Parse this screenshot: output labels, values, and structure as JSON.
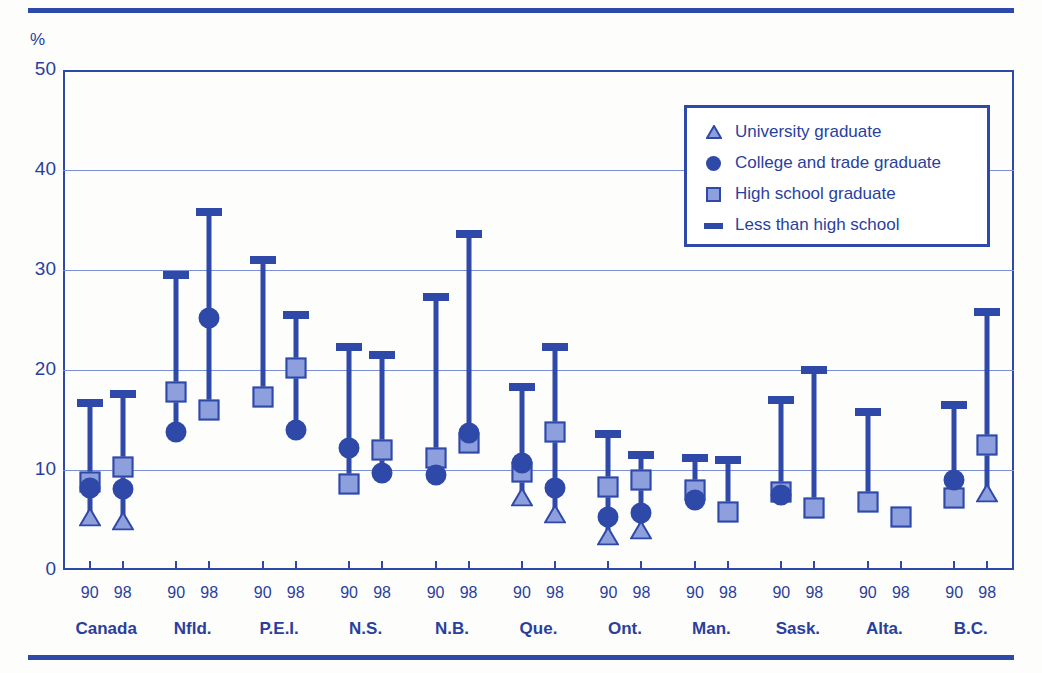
{
  "axis": {
    "y_unit_label": "%",
    "y_ticks": [
      "0",
      "10",
      "20",
      "30",
      "40",
      "50"
    ],
    "y_min": 0,
    "y_max": 50
  },
  "legend": {
    "position": "top-right-inside",
    "items": [
      {
        "symbol": "triangle",
        "label": "University graduate"
      },
      {
        "symbol": "circle",
        "label": "College and trade graduate"
      },
      {
        "symbol": "square",
        "label": "High school graduate"
      },
      {
        "symbol": "dash",
        "label": "Less than high school"
      }
    ]
  },
  "colors": {
    "line": "#2f49a8",
    "fill_light": "#8e9fdd",
    "text": "#2a3f9d",
    "gridline": "#7a8fd6",
    "background": "#fdfdfc"
  },
  "chart_data": {
    "type": "scatter",
    "title": "",
    "xlabel": "",
    "ylabel": "%",
    "ylim": [
      0,
      50
    ],
    "ytick_values": [
      0,
      10,
      20,
      30,
      40,
      50
    ],
    "grid": "horizontal",
    "legend_position": "top-right",
    "categories": [
      "Canada",
      "Nfld.",
      "P.E.I.",
      "N.S.",
      "N.B.",
      "Que.",
      "Ont.",
      "Man.",
      "Sask.",
      "Alta.",
      "B.C."
    ],
    "years": [
      "90",
      "98"
    ],
    "series": [
      {
        "name": "University graduate",
        "symbol": "triangle"
      },
      {
        "name": "College and trade graduate",
        "symbol": "circle"
      },
      {
        "name": "High school graduate",
        "symbol": "square"
      },
      {
        "name": "Less than high school",
        "symbol": "dash"
      }
    ],
    "groups": [
      {
        "region": "Canada",
        "year": "90",
        "university": 5.3,
        "college": 8.2,
        "high_school": 8.8,
        "less_than_high_school": 16.7
      },
      {
        "region": "Canada",
        "year": "98",
        "university": 4.9,
        "college": 8.1,
        "high_school": 10.3,
        "less_than_high_school": 17.6
      },
      {
        "region": "Nfld.",
        "year": "90",
        "university": null,
        "college": 13.8,
        "high_school": 17.8,
        "less_than_high_school": 29.5
      },
      {
        "region": "Nfld.",
        "year": "98",
        "university": null,
        "college": 25.2,
        "high_school": 16.0,
        "less_than_high_school": 35.8
      },
      {
        "region": "P.E.I.",
        "year": "90",
        "university": null,
        "college": null,
        "high_school": 17.3,
        "less_than_high_school": 31.0
      },
      {
        "region": "P.E.I.",
        "year": "98",
        "university": null,
        "college": 14.0,
        "high_school": 20.2,
        "less_than_high_school": 25.5
      },
      {
        "region": "N.S.",
        "year": "90",
        "university": null,
        "college": 12.2,
        "high_school": 8.6,
        "less_than_high_school": 22.3
      },
      {
        "region": "N.S.",
        "year": "98",
        "university": null,
        "college": 9.7,
        "high_school": 12.0,
        "less_than_high_school": 21.5
      },
      {
        "region": "N.B.",
        "year": "90",
        "university": null,
        "college": 9.5,
        "high_school": 11.2,
        "less_than_high_school": 27.3
      },
      {
        "region": "N.B.",
        "year": "98",
        "university": null,
        "college": 13.7,
        "high_school": 12.7,
        "less_than_high_school": 33.6
      },
      {
        "region": "Que.",
        "year": "90",
        "university": 7.3,
        "college": 10.7,
        "high_school": 9.8,
        "less_than_high_school": 18.3
      },
      {
        "region": "Que.",
        "year": "98",
        "university": 5.6,
        "college": 8.2,
        "high_school": 13.8,
        "less_than_high_school": 22.3
      },
      {
        "region": "Ont.",
        "year": "90",
        "university": 3.4,
        "college": 5.3,
        "high_school": 8.3,
        "less_than_high_school": 13.6
      },
      {
        "region": "Ont.",
        "year": "98",
        "university": 4.0,
        "college": 5.7,
        "high_school": 9.0,
        "less_than_high_school": 11.5
      },
      {
        "region": "Man.",
        "year": "90",
        "university": null,
        "college": 7.0,
        "high_school": 8.0,
        "less_than_high_school": 11.2
      },
      {
        "region": "Man.",
        "year": "98",
        "university": null,
        "college": null,
        "high_school": 5.8,
        "less_than_high_school": 11.0
      },
      {
        "region": "Sask.",
        "year": "90",
        "university": null,
        "college": 7.5,
        "high_school": 7.8,
        "less_than_high_school": 17.0
      },
      {
        "region": "Sask.",
        "year": "98",
        "university": null,
        "college": null,
        "high_school": 6.2,
        "less_than_high_school": 20.0
      },
      {
        "region": "Alta.",
        "year": "90",
        "university": null,
        "college": null,
        "high_school": 6.8,
        "less_than_high_school": 15.8
      },
      {
        "region": "Alta.",
        "year": "98",
        "university": null,
        "college": null,
        "high_school": 5.3,
        "less_than_high_school": null
      },
      {
        "region": "B.C.",
        "year": "90",
        "university": null,
        "college": 9.0,
        "high_school": 7.2,
        "less_than_high_school": 16.5
      },
      {
        "region": "B.C.",
        "year": "98",
        "university": 7.7,
        "college": null,
        "high_school": 12.5,
        "less_than_high_school": 25.8
      }
    ]
  }
}
